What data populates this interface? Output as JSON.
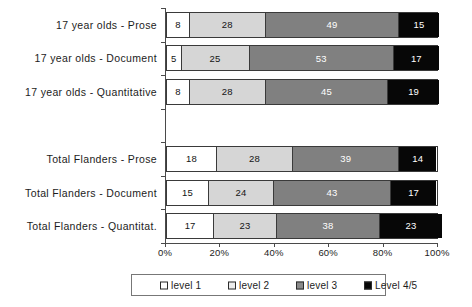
{
  "chart_data": {
    "type": "bar",
    "orientation": "horizontal",
    "stacked": true,
    "stack_mode": "percent",
    "title": "",
    "subtitle": "",
    "xlabel": "",
    "ylabel": "",
    "xlim": [
      0,
      100
    ],
    "xticks": [
      0,
      20,
      40,
      60,
      80,
      100
    ],
    "xticklabels": [
      "0%",
      "20%",
      "40%",
      "60%",
      "80%",
      "100%"
    ],
    "grid": false,
    "legend_position": "bottom",
    "categories": [
      "17 year olds - Prose",
      "17 year olds - Document",
      "17 year olds - Quantitative",
      "Total Flanders - Prose",
      "Total Flanders - Document",
      "Total Flanders - Quantitat."
    ],
    "series": [
      {
        "name": "level 1",
        "color": "#ffffff",
        "values": [
          8,
          5,
          8,
          18,
          15,
          17
        ]
      },
      {
        "name": "level 2",
        "color": "#d6d6d6",
        "values": [
          28,
          25,
          28,
          28,
          24,
          23
        ]
      },
      {
        "name": "level 3",
        "color": "#808080",
        "values": [
          49,
          53,
          45,
          39,
          43,
          38
        ]
      },
      {
        "name": "Level 4/5",
        "color": "#070707",
        "values": [
          15,
          17,
          19,
          14,
          17,
          23
        ]
      }
    ],
    "rows": [
      {
        "label": "17 year olds - Prose",
        "slot": 0,
        "segments": [
          8,
          28,
          49,
          15
        ]
      },
      {
        "label": "17 year olds - Document",
        "slot": 1,
        "segments": [
          5,
          25,
          53,
          17
        ]
      },
      {
        "label": "17 year olds - Quantitative",
        "slot": 2,
        "segments": [
          8,
          28,
          45,
          19
        ]
      },
      {
        "label": "Total Flanders - Prose",
        "slot": 4,
        "segments": [
          18,
          28,
          39,
          14
        ]
      },
      {
        "label": "Total Flanders - Document",
        "slot": 5,
        "segments": [
          15,
          24,
          43,
          17
        ]
      },
      {
        "label": "Total Flanders - Quantitat.",
        "slot": 6,
        "segments": [
          17,
          23,
          38,
          23
        ]
      }
    ],
    "legend": [
      "level 1",
      "level 2",
      "level 3",
      "Level 4/5"
    ]
  }
}
